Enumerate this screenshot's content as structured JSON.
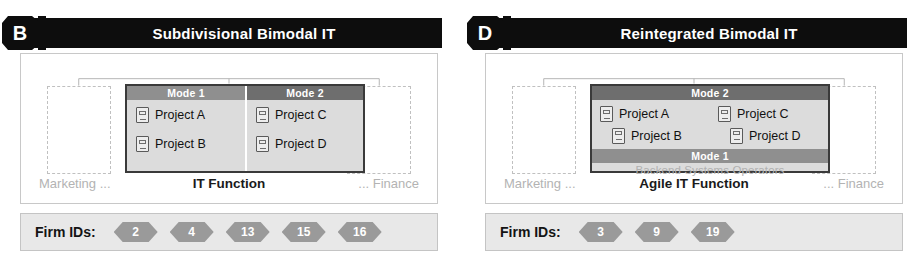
{
  "figure": {
    "panels": [
      {
        "badge": "B",
        "title": "Subdivisional Bimodal IT",
        "layout": "split",
        "left_unit_label": "Marketing ...",
        "right_unit_label": "... Finance",
        "function_label": "IT Function",
        "modes": [
          {
            "name": "Mode 1",
            "shade": "light",
            "projects": [
              "Project A",
              "Project B"
            ]
          },
          {
            "name": "Mode 2",
            "shade": "dark",
            "projects": [
              "Project C",
              "Project D"
            ]
          }
        ],
        "firm_ids_label": "Firm IDs:",
        "firm_ids": [
          "2",
          "4",
          "13",
          "15",
          "16"
        ]
      },
      {
        "badge": "D",
        "title": "Reintegrated Bimodal IT",
        "layout": "stacked",
        "left_unit_label": "Marketing ...",
        "right_unit_label": "... Finance",
        "function_label": "Agile IT Function",
        "mode2": {
          "name": "Mode 2",
          "projects": [
            "Project A",
            "Project C",
            "Project B",
            "Project D"
          ]
        },
        "mode1": {
          "name": "Mode 1",
          "subtitle": "Backend Systems Operators"
        },
        "firm_ids_label": "Firm IDs:",
        "firm_ids": [
          "3",
          "9",
          "19"
        ]
      }
    ]
  },
  "icons": {
    "project": "project-document-icon"
  },
  "colors": {
    "titlebar_bg": "#0d0d0d",
    "mode_header_light": "#8f8f8f",
    "mode_header_dark": "#6e6e6e",
    "container_bg": "#dcdcdc",
    "firm_hex": "#9a9a9a",
    "muted_text": "#b3b3b3"
  }
}
